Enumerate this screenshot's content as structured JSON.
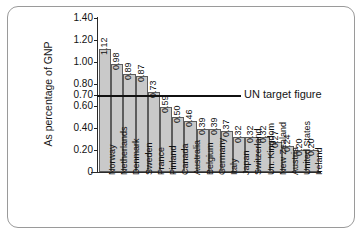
{
  "chart_data": {
    "type": "bar",
    "title": "",
    "subtitle": "",
    "xlabel": "",
    "ylabel": "As percentage of GNP",
    "ylim": [
      0,
      1.4
    ],
    "grid": false,
    "legend_position": "none",
    "orientation": "vertical",
    "bar_color": "#c9c9c9",
    "bar_edge_color": "#5d5d5d",
    "y_ticks": [
      "1.40",
      "1.20",
      "1.00",
      "0.80",
      "0.70",
      "0.60",
      "0.40",
      "0.20",
      "0"
    ],
    "y_tick_values": [
      1.4,
      1.2,
      1.0,
      0.8,
      0.7,
      0.6,
      0.4,
      0.2,
      0
    ],
    "categories": [
      "Norway",
      "Netherlands",
      "Denmark",
      "Sweden",
      "France",
      "Finland",
      "Canada",
      "Australia",
      "Belgium",
      "Germany",
      "Italy",
      "Japan",
      "Switzerland",
      "Un. Kingdom",
      "New Zealand",
      "Austria",
      "United States",
      "Ireland"
    ],
    "values": [
      1.12,
      0.98,
      0.89,
      0.87,
      0.73,
      0.59,
      0.5,
      0.46,
      0.39,
      0.39,
      0.37,
      0.32,
      0.32,
      0.32,
      0.27,
      0.24,
      0.2,
      0.2
    ],
    "value_labels": [
      "1.12",
      "0.98",
      "0.89",
      "0.87",
      "0.73",
      "0.59",
      "0.50",
      "0.46",
      "0.39",
      "0.39",
      "0.37",
      "0.32",
      "0.32",
      "0.32",
      "0.27",
      "0.24",
      "0.20",
      "0.20"
    ],
    "annotations": [
      {
        "name": "un-target-figure",
        "label": "UN target figure",
        "y_value": 0.7,
        "color": "#111111"
      }
    ]
  }
}
